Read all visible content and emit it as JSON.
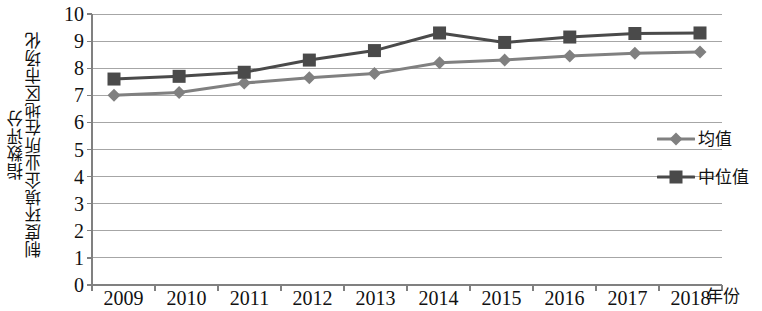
{
  "chart_data": {
    "type": "line",
    "title": "",
    "xlabel": "年份",
    "ylabel": "制度环境企业所在地区市场化指数评分",
    "ylabel_lines": [
      "制度环境企业所在地区市场化",
      "指数评分"
    ],
    "categories": [
      "2009",
      "2010",
      "2011",
      "2012",
      "2013",
      "2014",
      "2015",
      "2016",
      "2017",
      "2018"
    ],
    "x": [
      2009,
      2010,
      2011,
      2012,
      2013,
      2014,
      2015,
      2016,
      2017,
      2018
    ],
    "ylim": [
      0,
      10
    ],
    "y_ticks": [
      10,
      9,
      8,
      7,
      6,
      5,
      4,
      3,
      2,
      1,
      0
    ],
    "grid": true,
    "grid_axis": "y",
    "legend_position": "right",
    "series": [
      {
        "name": "均值",
        "marker": "diamond",
        "color": "#808080",
        "values": [
          7.0,
          7.1,
          7.45,
          7.65,
          7.8,
          8.2,
          8.3,
          8.45,
          8.55,
          8.6
        ]
      },
      {
        "name": "中位值",
        "marker": "square",
        "color": "#4a4a4a",
        "values": [
          7.6,
          7.7,
          7.85,
          8.3,
          8.65,
          9.3,
          8.95,
          9.15,
          9.28,
          9.3
        ]
      }
    ]
  },
  "colors": {
    "mean_series": "#808080",
    "median_series": "#4a4a4a",
    "gridline": "#a6a6a6",
    "axis": "#808080",
    "text": "#111111",
    "background": "#ffffff"
  },
  "legend": {
    "items": [
      {
        "label": "均值",
        "marker": "diamond-marker-icon"
      },
      {
        "label": "中位值",
        "marker": "square-marker-icon"
      }
    ]
  },
  "axes": {
    "x_title": "年份",
    "y_title_line1": "制度环境企业所在地区市场化",
    "y_title_line2": "指数评分"
  }
}
